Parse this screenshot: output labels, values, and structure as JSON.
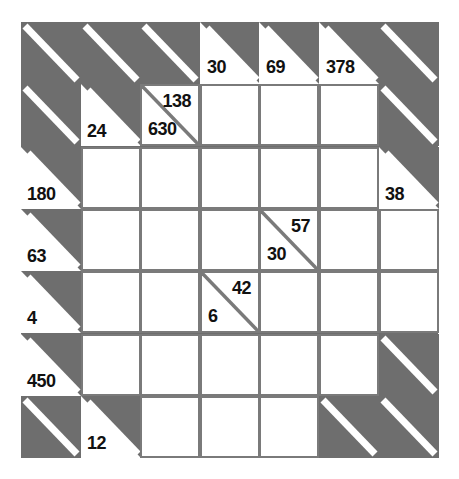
{
  "puzzle": {
    "type": "kakuro-style product grid",
    "rows": 7,
    "cols": 7,
    "cell_width": 59.6,
    "cell_height": 62.3,
    "colors": {
      "blocked": "#6e6e6e",
      "cell": "#ffffff",
      "gridline": "#7a7a7a",
      "stripe": "#ffffff",
      "text": "#111111",
      "page_background": "#ffffff"
    },
    "grid": [
      [
        {
          "kind": "dark"
        },
        {
          "kind": "dark"
        },
        {
          "kind": "dark"
        },
        {
          "kind": "clue",
          "down": "30"
        },
        {
          "kind": "clue",
          "down": "69"
        },
        {
          "kind": "clue",
          "down": "378"
        },
        {
          "kind": "dark"
        }
      ],
      [
        {
          "kind": "dark"
        },
        {
          "kind": "clue",
          "down": "24"
        },
        {
          "kind": "split",
          "down": "630",
          "across": "138"
        },
        {
          "kind": "white"
        },
        {
          "kind": "white"
        },
        {
          "kind": "white"
        },
        {
          "kind": "dark"
        }
      ],
      [
        {
          "kind": "clue",
          "down": "180"
        },
        {
          "kind": "white"
        },
        {
          "kind": "white"
        },
        {
          "kind": "white"
        },
        {
          "kind": "white"
        },
        {
          "kind": "white"
        },
        {
          "kind": "clue",
          "down": "38"
        }
      ],
      [
        {
          "kind": "clue",
          "down": "63"
        },
        {
          "kind": "white"
        },
        {
          "kind": "white"
        },
        {
          "kind": "white"
        },
        {
          "kind": "split",
          "down": "30",
          "across": "57"
        },
        {
          "kind": "white"
        },
        {
          "kind": "white"
        }
      ],
      [
        {
          "kind": "clue",
          "down": "4"
        },
        {
          "kind": "white"
        },
        {
          "kind": "white"
        },
        {
          "kind": "split",
          "down": "6",
          "across": "42"
        },
        {
          "kind": "white"
        },
        {
          "kind": "white"
        },
        {
          "kind": "white"
        }
      ],
      [
        {
          "kind": "clue",
          "down": "450"
        },
        {
          "kind": "white"
        },
        {
          "kind": "white"
        },
        {
          "kind": "white"
        },
        {
          "kind": "white"
        },
        {
          "kind": "white"
        },
        {
          "kind": "dark"
        }
      ],
      [
        {
          "kind": "dark"
        },
        {
          "kind": "clue",
          "down": "12"
        },
        {
          "kind": "white"
        },
        {
          "kind": "white"
        },
        {
          "kind": "white"
        },
        {
          "kind": "dark"
        },
        {
          "kind": "dark"
        }
      ]
    ]
  }
}
